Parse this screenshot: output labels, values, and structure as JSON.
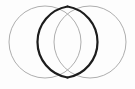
{
  "figure": {
    "background_color": "#fdfdfd",
    "width": 135,
    "height": 89
  },
  "chart_data": {
    "type": "diagram",
    "title": "",
    "shapes": [
      {
        "name": "left-circle",
        "type": "circle",
        "cx": 45,
        "cy": 42,
        "r": 36,
        "stroke": "#aeaeae",
        "stroke_width": 1,
        "fill": "none"
      },
      {
        "name": "right-circle",
        "type": "circle",
        "cx": 90,
        "cy": 42,
        "r": 36,
        "stroke": "#aeaeae",
        "stroke_width": 1,
        "fill": "none"
      },
      {
        "name": "intersection-lens",
        "type": "lens",
        "left_arc_path": "M 67.5 6.5 A 36 36 0 0 0 67.5 77.5",
        "right_arc_path": "M 67.5 6.5 A 36 36 0 0 1 67.5 77.5",
        "stroke": "#1c1c1c",
        "stroke_width": 2.2,
        "fill": "none",
        "top_crossing_x": 67.5,
        "top_crossing_y": 6.5,
        "bottom_crossing_x": 67.5,
        "bottom_crossing_y": 77.5,
        "widest_left_x": 54,
        "widest_right_x": 81,
        "widest_y": 42
      }
    ],
    "colors": {
      "thin_outline": "#aeaeae",
      "bold_lens": "#1c1c1c",
      "background": "#fdfdfd"
    },
    "labels": [],
    "legend": []
  }
}
